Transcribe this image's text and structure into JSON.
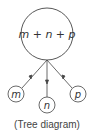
{
  "diagram": {
    "root": {
      "label": "m + n + p"
    },
    "children": [
      {
        "label": "m"
      },
      {
        "label": "n"
      },
      {
        "label": "p"
      }
    ],
    "caption": "(Tree diagram)",
    "colors": {
      "stroke": "#444444",
      "text": "#333333",
      "background": "#ffffff"
    }
  }
}
